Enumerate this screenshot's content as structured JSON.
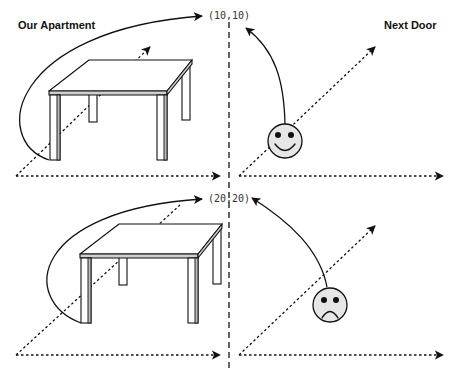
{
  "panels": {
    "left_title": "Our Apartment",
    "right_title": "Next Door"
  },
  "scenes": [
    {
      "name": "top",
      "coordinate_label": "(10,10)",
      "face": {
        "mood": "happy",
        "icon": "smiley-face-icon"
      },
      "object": {
        "icon": "table-icon"
      }
    },
    {
      "name": "bottom",
      "coordinate_label": "(20,20)",
      "face": {
        "mood": "sad",
        "icon": "frowning-face-icon"
      },
      "object": {
        "icon": "table-icon"
      }
    }
  ],
  "colors": {
    "ink": "#111111",
    "face_fill": "#e6e6e6",
    "table_edge": "#cfcfcf",
    "background": "#ffffff"
  }
}
